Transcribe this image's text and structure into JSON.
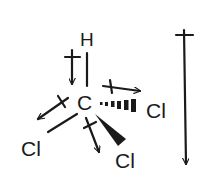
{
  "diagram": {
    "molecule": "CHCl3",
    "atoms": {
      "h": "H",
      "c": "C",
      "cl_right": "Cl",
      "cl_left": "Cl",
      "cl_bottom": "Cl"
    },
    "bonds": [
      {
        "from": "C",
        "to": "H",
        "style": "plain"
      },
      {
        "from": "C",
        "to": "Cl (right)",
        "style": "hashed-wedge"
      },
      {
        "from": "C",
        "to": "Cl (left)",
        "style": "plain"
      },
      {
        "from": "C",
        "to": "Cl (bottom)",
        "style": "solid-wedge"
      }
    ],
    "dipole_arrows": [
      {
        "bond": "C-H",
        "direction": "toward C"
      },
      {
        "bond": "C-Cl right",
        "direction": "toward Cl"
      },
      {
        "bond": "C-Cl left",
        "direction": "toward Cl"
      },
      {
        "bond": "C-Cl bottom",
        "direction": "toward Cl"
      },
      {
        "bond": "net",
        "direction": "downward"
      }
    ],
    "colors": {
      "ink": "#1a1a1a",
      "background": "#ffffff"
    }
  }
}
